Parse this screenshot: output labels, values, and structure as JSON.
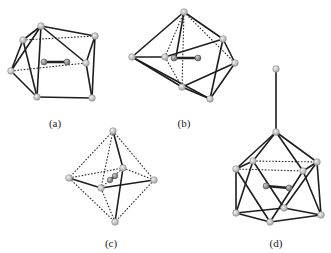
{
  "figure": {
    "panels": [
      {
        "id": "a",
        "label": "(a)",
        "description": "polyhedral cage with encapsulated diatomic unit",
        "label_pos": [
          55,
          123
        ]
      },
      {
        "id": "b",
        "label": "(b)",
        "description": "polyhedral cage with encapsulated diatomic unit",
        "label_pos": [
          184,
          123
        ]
      },
      {
        "id": "c",
        "label": "(c)",
        "description": "octahedral cage with encapsulated diatomic unit",
        "label_pos": [
          111,
          243
        ]
      },
      {
        "id": "d",
        "label": "(d)",
        "description": "icosahedral-type cage with capping atom and encapsulated diatomic unit",
        "label_pos": [
          276,
          243
        ]
      }
    ],
    "colors": {
      "background": "#ffffff",
      "edge": "#1e1e1e",
      "atom_fill": "#c8c8c8",
      "atom_stroke": "#8a8a8a",
      "inner_atom": "#8c8c8c"
    }
  }
}
